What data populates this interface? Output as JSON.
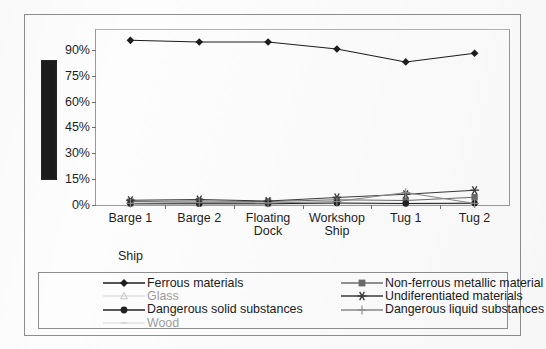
{
  "chart_data": {
    "type": "line",
    "title": "",
    "xlabel": "Ship",
    "ylabel": "",
    "ylabel_redacted": true,
    "grid": false,
    "legend_position": "bottom",
    "ylim": [
      0,
      100
    ],
    "ytick_labels": [
      "90%",
      "75%",
      "60%",
      "45%",
      "30%",
      "15%",
      "0%"
    ],
    "ytick_values": [
      90,
      75,
      60,
      45,
      30,
      15,
      0
    ],
    "categories": [
      "Barge 1",
      "Barge 2",
      "Floating\nDock",
      "Workshop\nShip",
      "Tug 1",
      "Tug 2"
    ],
    "series": [
      {
        "name": "Ferrous materials",
        "marker": "diamond",
        "color": "#1d1d1d",
        "faint": false,
        "values": [
          95.5,
          94.5,
          94.5,
          90.5,
          83.0,
          88.0
        ]
      },
      {
        "name": "Non-ferrous metallic material",
        "marker": "square",
        "color": "#6b6b6b",
        "faint": false,
        "values": [
          2.0,
          2.3,
          2.0,
          3.0,
          2.6,
          4.5
        ]
      },
      {
        "name": "Glass",
        "marker": "triangle",
        "color": "#c8c8c8",
        "faint": true,
        "values": [
          0.6,
          0.8,
          0.7,
          1.0,
          1.0,
          1.2
        ]
      },
      {
        "name": "Undiferentiated materials",
        "marker": "star",
        "color": "#3a3a3a",
        "faint": false,
        "values": [
          2.8,
          3.2,
          2.3,
          4.4,
          6.2,
          8.6
        ]
      },
      {
        "name": "Dangerous solid substances",
        "marker": "circle",
        "color": "#222222",
        "faint": false,
        "values": [
          0.8,
          0.7,
          0.8,
          1.2,
          0.9,
          1.0
        ]
      },
      {
        "name": "Dangerous liquid substances",
        "marker": "plus",
        "color": "#8a8a8a",
        "faint": false,
        "values": [
          1.0,
          1.4,
          1.2,
          2.0,
          7.2,
          0.9
        ]
      },
      {
        "name": "Wood",
        "marker": "bar",
        "color": "#cfcfcf",
        "faint": true,
        "values": [
          0.4,
          0.5,
          0.4,
          0.7,
          0.6,
          0.7
        ]
      }
    ],
    "legend_columns": {
      "left": [
        "Ferrous materials",
        "Glass",
        "Dangerous solid substances",
        "Wood"
      ],
      "right": [
        "Non-ferrous metallic material",
        "Undiferentiated materials",
        "Dangerous liquid substances"
      ]
    }
  }
}
